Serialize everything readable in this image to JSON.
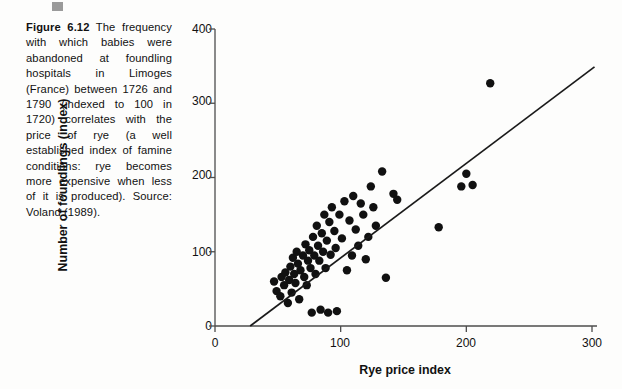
{
  "figure": {
    "label": "Figure 6.12",
    "caption_bold": "Figure 6.12",
    "caption_rest": "  The frequency with which babies were abandoned at foundling hospitals in Limoges (France) between 1726 and 1790 (indexed to 100 in 1720) correlates with the price of rye (a well established index of famine conditions: rye becomes more expensive when less of it is produced). Source: Voland (1989).",
    "caption_full": "Figure 6.12  The frequency with which babies were abandoned at foundling hospitals in Limoges (France) between 1726 and 1790 (indexed to 100 in 1720) correlates with the price of rye (a well established index of famine conditions: rye becomes more expensive when less of it is produced). Source: Voland (1989).",
    "source": "Voland (1989)."
  },
  "colors": {
    "point": "#111111",
    "axis": "#4d4d4d",
    "trendline": "#1a1a1a",
    "text": "#111111",
    "page_background": "#fdfdfc",
    "top_mark": "#9a9a9a"
  },
  "chart_data": {
    "type": "scatter",
    "title": "",
    "xlabel": "Rye price index",
    "ylabel": "Number of foundlings (index)",
    "xlim": [
      0,
      300
    ],
    "ylim": [
      0,
      400
    ],
    "xticks": [
      0,
      100,
      200,
      300
    ],
    "yticks": [
      0,
      100,
      200,
      300,
      400
    ],
    "xtick_labels": [
      "0",
      "100",
      "200",
      "300"
    ],
    "ytick_labels": [
      "0",
      "100",
      "200",
      "300",
      "400"
    ],
    "grid": false,
    "legend": null,
    "point_radius_px": 4.2,
    "marker": "filled-circle",
    "trendline": {
      "type": "linear-fit",
      "x_start": 28,
      "y_start": 0,
      "x_end": 302,
      "y_end": 349
    },
    "points": [
      [
        47,
        60
      ],
      [
        49,
        47
      ],
      [
        52,
        40
      ],
      [
        53,
        66
      ],
      [
        55,
        55
      ],
      [
        56,
        72
      ],
      [
        58,
        31
      ],
      [
        59,
        62
      ],
      [
        60,
        80
      ],
      [
        61,
        45
      ],
      [
        62,
        92
      ],
      [
        63,
        70
      ],
      [
        64,
        58
      ],
      [
        65,
        100
      ],
      [
        66,
        84
      ],
      [
        67,
        36
      ],
      [
        68,
        75
      ],
      [
        70,
        95
      ],
      [
        71,
        66
      ],
      [
        72,
        110
      ],
      [
        73,
        55
      ],
      [
        74,
        88
      ],
      [
        75,
        102
      ],
      [
        76,
        78
      ],
      [
        77,
        18
      ],
      [
        78,
        120
      ],
      [
        79,
        95
      ],
      [
        80,
        70
      ],
      [
        81,
        135
      ],
      [
        82,
        108
      ],
      [
        83,
        88
      ],
      [
        84,
        22
      ],
      [
        85,
        125
      ],
      [
        86,
        100
      ],
      [
        87,
        150
      ],
      [
        88,
        78
      ],
      [
        89,
        115
      ],
      [
        90,
        18
      ],
      [
        91,
        140
      ],
      [
        92,
        96
      ],
      [
        93,
        160
      ],
      [
        95,
        128
      ],
      [
        96,
        105
      ],
      [
        97,
        20
      ],
      [
        99,
        150
      ],
      [
        101,
        118
      ],
      [
        103,
        168
      ],
      [
        105,
        75
      ],
      [
        107,
        142
      ],
      [
        109,
        95
      ],
      [
        110,
        175
      ],
      [
        112,
        130
      ],
      [
        114,
        108
      ],
      [
        116,
        165
      ],
      [
        118,
        150
      ],
      [
        120,
        90
      ],
      [
        122,
        120
      ],
      [
        124,
        188
      ],
      [
        126,
        160
      ],
      [
        128,
        135
      ],
      [
        133,
        208
      ],
      [
        136,
        65
      ],
      [
        142,
        178
      ],
      [
        145,
        170
      ],
      [
        178,
        133
      ],
      [
        196,
        188
      ],
      [
        200,
        205
      ],
      [
        205,
        190
      ],
      [
        219,
        327
      ]
    ]
  }
}
